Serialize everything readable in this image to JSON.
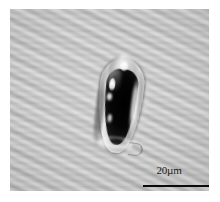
{
  "figure": {
    "kind": "light-microscopy-micrograph",
    "modality": "brightfield / phase-contrast grayscale",
    "background_color": "#bdbdbd",
    "border_color": "#ffffff",
    "specimen_color": "#050505",
    "rim_color": "#efefef"
  },
  "scalebar": {
    "label": "20µm",
    "value": 20,
    "unit": "µm",
    "line_color": "#0a0a0a",
    "position": "bottom-right"
  }
}
